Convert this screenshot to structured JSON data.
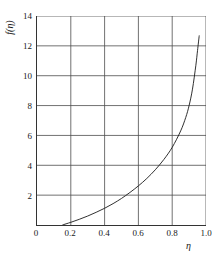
{
  "chart_data": {
    "type": "line",
    "title": "",
    "xlabel": "η",
    "ylabel": "f(η)",
    "xlim": [
      0,
      1.0
    ],
    "ylim": [
      0,
      14
    ],
    "grid": true,
    "legend": null,
    "xticks": [
      "0",
      "0.2",
      "0.4",
      "0.6",
      "0.8",
      "1.0"
    ],
    "xtick_values": [
      0,
      0.2,
      0.4,
      0.6,
      0.8,
      1.0
    ],
    "yticks": [
      "2",
      "4",
      "6",
      "8",
      "10",
      "12",
      "14"
    ],
    "ytick_values": [
      2,
      4,
      6,
      8,
      10,
      12,
      14
    ],
    "series": [
      {
        "name": "f(η)",
        "color": "#1a1a1a",
        "x": [
          0.15,
          0.2,
          0.25,
          0.3,
          0.35,
          0.4,
          0.45,
          0.5,
          0.55,
          0.6,
          0.65,
          0.7,
          0.75,
          0.8,
          0.85,
          0.88,
          0.9,
          0.92,
          0.94,
          0.95,
          0.96
        ],
        "y": [
          0.0,
          0.18,
          0.38,
          0.6,
          0.85,
          1.12,
          1.43,
          1.78,
          2.18,
          2.62,
          3.12,
          3.7,
          4.38,
          5.2,
          6.3,
          7.2,
          8.0,
          9.1,
          10.7,
          11.7,
          12.7
        ]
      }
    ]
  },
  "axes": {
    "ylabel_text": "f(η)",
    "xlabel_text": "η"
  }
}
